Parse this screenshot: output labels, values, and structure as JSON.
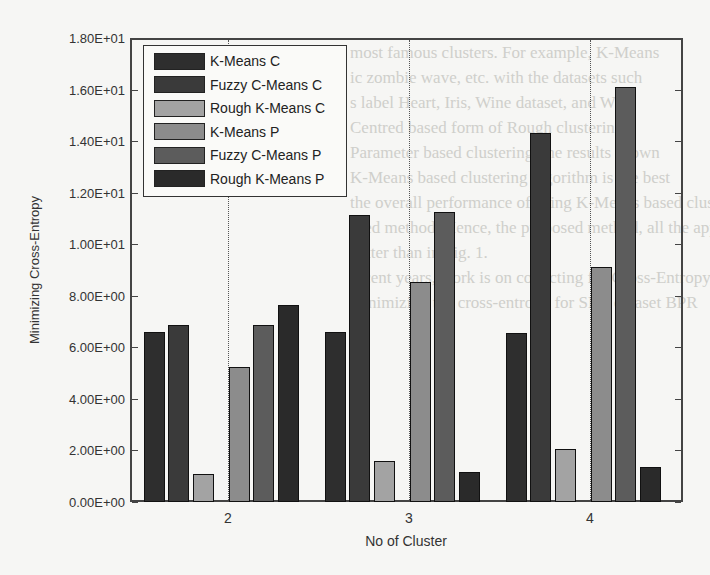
{
  "chart_data": {
    "type": "bar",
    "title": "",
    "xlabel": "No of Cluster",
    "ylabel": "Minimizing Cross-Entropy",
    "ylim": [
      0,
      18
    ],
    "yticks": [
      "0.00E+00",
      "2.00E+00",
      "4.00E+00",
      "6.00E+00",
      "8.00E+00",
      "1.00E+01",
      "1.20E+01",
      "1.40E+01",
      "1.60E+01",
      "1.80E+01"
    ],
    "categories": [
      "2",
      "3",
      "4"
    ],
    "grid": "vertical dotted at category centers",
    "legend_position": "upper-left",
    "series": [
      {
        "name": "K-Means C",
        "color": "#2e2e2e",
        "values": [
          6.6,
          6.6,
          6.55
        ]
      },
      {
        "name": "Fuzzy C-Means C",
        "color": "#3a3a3a",
        "values": [
          6.85,
          11.15,
          14.3
        ]
      },
      {
        "name": "Rough K-Means C",
        "color": "#a3a3a3",
        "values": [
          1.1,
          1.6,
          2.05
        ]
      },
      {
        "name": "K-Means P",
        "color": "#8c8c8c",
        "values": [
          5.25,
          8.55,
          9.1
        ]
      },
      {
        "name": "Fuzzy C-Means P",
        "color": "#5c5c5c",
        "values": [
          6.85,
          11.25,
          16.1
        ]
      },
      {
        "name": "Rough K-Means P",
        "color": "#2a2a2a",
        "values": [
          7.65,
          1.15,
          1.35
        ]
      }
    ]
  },
  "background_text": [
    "most famous clusters. For example, K-Means",
    "ic zombie wave, etc. with the datasets such",
    "s label Heart, Iris, Wine dataset, and Wine",
    "Centred based form of Rough clustering",
    "Parameter based clustering, the results shown",
    "K-Means based clustering algorithm is the best",
    "the overall performance of using K-Means based clustering",
    "ased method. Hence, the proposed method, all the approach",
    "  better than in Fig. 1.",
    "",
    "   recent years, work is on collecting for Cross-Entropy",
    "  minimizing the cross-entropy for SEC dataset BPR"
  ]
}
